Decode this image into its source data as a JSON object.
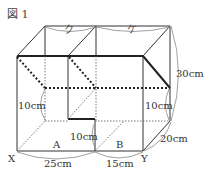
{
  "figure": {
    "title": "図 1",
    "labels": {
      "ku": "ク",
      "ke": "ケ",
      "height_total": "30cm",
      "step_left": "10cm",
      "step_middle": "10cm",
      "step_right": "10cm",
      "depth": "20cm",
      "width_a": "25cm",
      "width_b": "15cm",
      "region_a": "A",
      "region_b": "B",
      "corner_x": "X",
      "corner_y": "Y"
    },
    "colors": {
      "line": "#333333",
      "bold": "#222222",
      "arc": "#888888"
    }
  }
}
